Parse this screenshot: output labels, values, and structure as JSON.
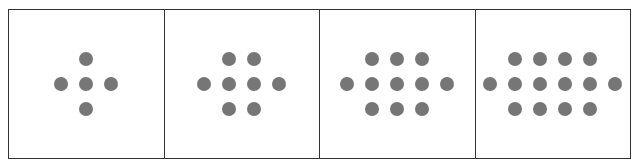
{
  "diagram": {
    "dot_color": "#767676",
    "panels": [
      {
        "index": 1,
        "top_row": 1,
        "middle_row": 3,
        "bottom_row": 1,
        "total": 5
      },
      {
        "index": 2,
        "top_row": 2,
        "middle_row": 4,
        "bottom_row": 2,
        "total": 8
      },
      {
        "index": 3,
        "top_row": 3,
        "middle_row": 5,
        "bottom_row": 3,
        "total": 11
      },
      {
        "index": 4,
        "top_row": 4,
        "middle_row": 6,
        "bottom_row": 4,
        "total": 14
      }
    ]
  }
}
